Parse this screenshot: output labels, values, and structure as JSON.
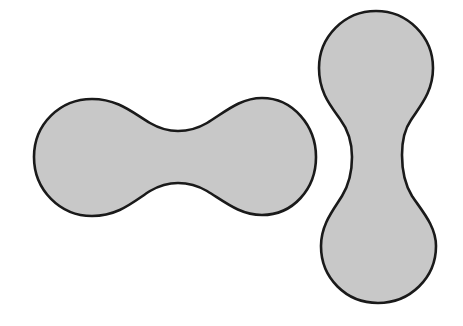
{
  "diagram": {
    "fill_color": "#c8c8c8",
    "stroke_color": "#1a1a1a",
    "shapes": [
      {
        "name": "horizontal-dumbbell",
        "orientation": "horizontal"
      },
      {
        "name": "vertical-dumbbell",
        "orientation": "vertical"
      }
    ]
  }
}
